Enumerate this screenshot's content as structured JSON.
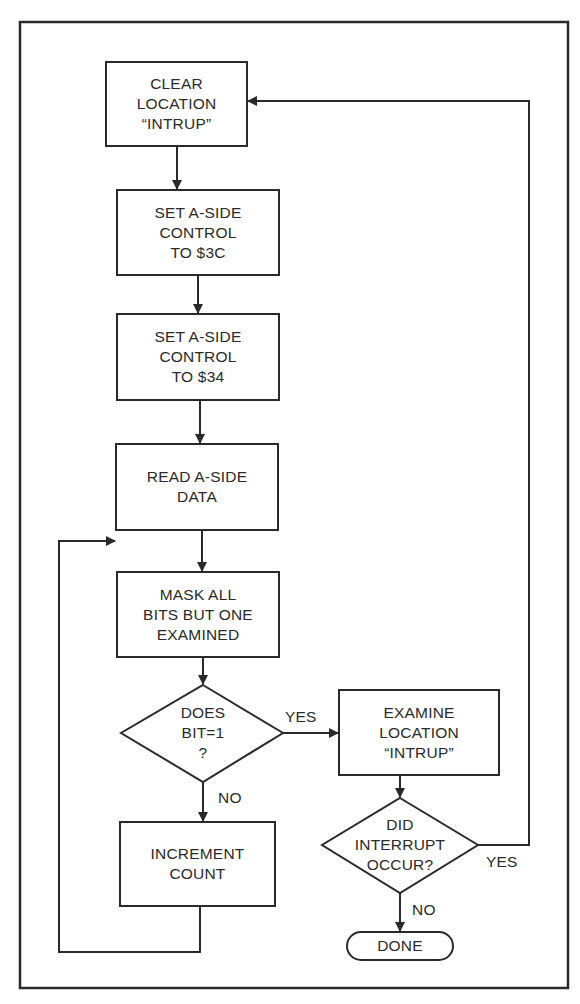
{
  "flowchart": {
    "nodes": {
      "clear_intrup": {
        "type": "process",
        "label": "CLEAR\nLOCATION\n“INTRUP”"
      },
      "set_3c": {
        "type": "process",
        "label": "SET A-SIDE\nCONTROL\nTO $3C"
      },
      "set_34": {
        "type": "process",
        "label": "SET A-SIDE\nCONTROL\nTO $34"
      },
      "read_data": {
        "type": "process",
        "label": "READ A-SIDE\nDATA"
      },
      "mask_bits": {
        "type": "process",
        "label": "MASK ALL\nBITS BUT ONE\nEXAMINED"
      },
      "does_bit": {
        "type": "decision",
        "label": "DOES\nBIT=1\n?"
      },
      "examine_intrup": {
        "type": "process",
        "label": "EXAMINE\nLOCATION\n“INTRUP”"
      },
      "did_interrupt": {
        "type": "decision",
        "label": "DID\nINTERRUPT\nOCCUR?"
      },
      "increment_count": {
        "type": "process",
        "label": "INCREMENT\nCOUNT"
      },
      "done": {
        "type": "terminator",
        "label": "DONE"
      }
    },
    "edge_labels": {
      "bit_yes": "YES",
      "bit_no": "NO",
      "interrupt_yes": "YES",
      "interrupt_no": "NO"
    },
    "edges": [
      {
        "from": "clear_intrup",
        "to": "set_3c"
      },
      {
        "from": "set_3c",
        "to": "set_34"
      },
      {
        "from": "set_34",
        "to": "read_data"
      },
      {
        "from": "read_data",
        "to": "mask_bits"
      },
      {
        "from": "mask_bits",
        "to": "does_bit"
      },
      {
        "from": "does_bit",
        "to": "examine_intrup",
        "label": "YES"
      },
      {
        "from": "does_bit",
        "to": "increment_count",
        "label": "NO"
      },
      {
        "from": "increment_count",
        "to": "read_data"
      },
      {
        "from": "examine_intrup",
        "to": "did_interrupt"
      },
      {
        "from": "did_interrupt",
        "to": "clear_intrup",
        "label": "YES"
      },
      {
        "from": "did_interrupt",
        "to": "done",
        "label": "NO"
      }
    ]
  },
  "colors": {
    "ink": "#2a2a2a",
    "paper": "#ffffff"
  }
}
